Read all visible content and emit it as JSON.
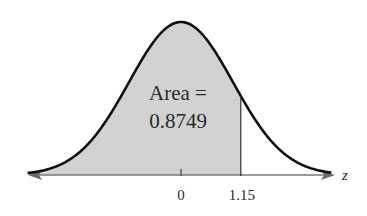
{
  "chart_data": {
    "type": "area",
    "title": "",
    "distribution": "standard normal",
    "xlabel": "z",
    "ylabel": "",
    "tick_labels": [
      "0",
      "1.15"
    ],
    "ticks": [
      0,
      1.15
    ],
    "shaded_region": {
      "from": "-inf",
      "to": 1.15,
      "area": 0.8749
    },
    "annotation": {
      "line1": "Area =",
      "line2": "0.8749"
    },
    "grid": false,
    "legend": null
  },
  "colors": {
    "curve": "#111111",
    "fill": "#d2d2d2",
    "axis": "#7a7a7a",
    "text": "#2a2a2a"
  }
}
